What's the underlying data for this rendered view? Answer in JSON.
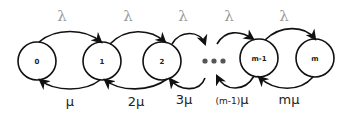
{
  "diagram": {
    "type": "birth-death-markov-chain",
    "states": [
      {
        "id": "s0",
        "label": "0"
      },
      {
        "id": "s1",
        "label": "1"
      },
      {
        "id": "s2",
        "label": "2"
      },
      {
        "id": "sm1",
        "label": "m-1"
      },
      {
        "id": "sm",
        "label": "m"
      }
    ],
    "ellipsis": "•••",
    "arrival_labels": [
      "λ",
      "λ",
      "λ",
      "λ",
      "λ"
    ],
    "service_labels": [
      {
        "prefix": "",
        "mu": "μ"
      },
      {
        "prefix": "2",
        "mu": "μ"
      },
      {
        "prefix": "3",
        "mu": "μ"
      },
      {
        "prefix": "(m-1)",
        "mu": "μ"
      },
      {
        "prefix": "m",
        "mu": "μ"
      }
    ],
    "colors": {
      "stroke": "#111111",
      "lambda": "#9a9a9a",
      "dots": "#555555"
    }
  }
}
